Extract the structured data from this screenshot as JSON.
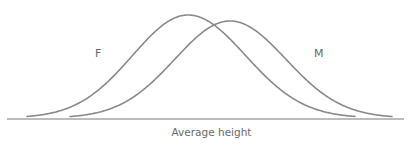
{
  "chart_data": {
    "type": "line",
    "title": "",
    "xlabel": "Average height",
    "ylabel": "",
    "grid": false,
    "legend": "inline labels",
    "x_ticks": [],
    "y_ticks": [],
    "series": [
      {
        "name": "F",
        "shape": "normal distribution curve",
        "relative_mean": 0.46,
        "relative_peak_height": 1.0,
        "relative_span": [
          0.05,
          0.88
        ]
      },
      {
        "name": "M",
        "shape": "normal distribution curve",
        "relative_mean": 0.56,
        "relative_peak_height": 0.94,
        "relative_span": [
          0.16,
          0.96
        ]
      }
    ],
    "annotations": [
      {
        "text": "F",
        "position": "left of female curve"
      },
      {
        "text": "M",
        "position": "right of male curve"
      }
    ]
  },
  "labels": {
    "female": "F",
    "male": "M",
    "x_axis": "Average height"
  },
  "colors": {
    "curve": "#8a8a8a",
    "axis": "#7a7a7a",
    "text": "#6a6a6a"
  },
  "geometry": {
    "axis": {
      "x1": 7,
      "x2": 404,
      "y": 119
    },
    "female": {
      "start": 27,
      "peak_x": 188,
      "peak_y": 15,
      "end": 355
    },
    "male": {
      "start": 70,
      "peak_x": 230,
      "peak_y": 21,
      "end": 392
    }
  }
}
